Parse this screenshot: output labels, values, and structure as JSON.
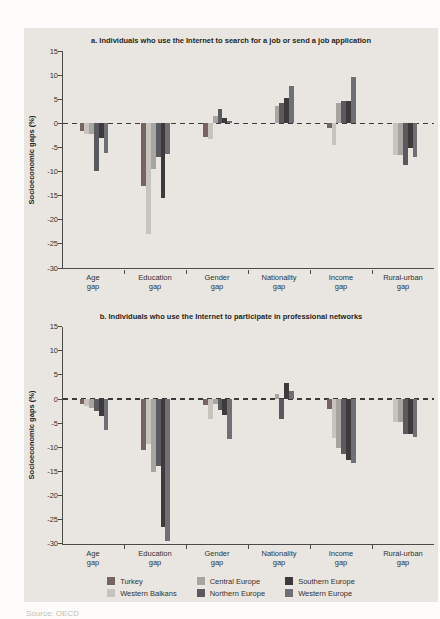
{
  "figure": {
    "source_text": "Source: OECD"
  },
  "legend": {
    "items": [
      {
        "label": "Turkey",
        "color": "#756460"
      },
      {
        "label": "Central Europe",
        "color": "#a8a5a0"
      },
      {
        "label": "Southern Europe",
        "color": "#3e3a3c"
      },
      {
        "label": "Western Balkans",
        "color": "#c7c3be"
      },
      {
        "label": "Northern Europe",
        "color": "#585a60"
      },
      {
        "label": "Western Europe",
        "color": "#6f7076"
      }
    ]
  },
  "chart_data": [
    {
      "type": "bar",
      "title": "a. Individuals who use the Internet to search for a job or send a job application",
      "xlabel": "",
      "ylabel": "Socioeconomic gaps (%)",
      "ylim": [
        -30,
        15
      ],
      "yticks": [
        15,
        10,
        5,
        0,
        -5,
        -10,
        -15,
        -20,
        -25,
        -30
      ],
      "grid": false,
      "zero_baseline": "dashed",
      "legend_position": "below-figure",
      "categories": [
        "Age gap",
        "Education gap",
        "Gender gap",
        "Nationality gap",
        "Income gap",
        "Rural-urban gap"
      ],
      "series": [
        {
          "name": "Turkey",
          "color": "#756460",
          "values": [
            -1.5,
            -13.0,
            -2.8,
            null,
            -1.0,
            null
          ]
        },
        {
          "name": "Western Balkans",
          "color": "#c7c3be",
          "values": [
            -2.2,
            -23.0,
            -3.2,
            null,
            -4.5,
            -6.5
          ]
        },
        {
          "name": "Central Europe",
          "color": "#a8a5a0",
          "values": [
            -2.2,
            -9.5,
            1.5,
            3.5,
            4.2,
            -6.5
          ]
        },
        {
          "name": "Northern Europe",
          "color": "#585a60",
          "values": [
            -9.8,
            -7.0,
            3.0,
            4.2,
            4.6,
            -8.6
          ]
        },
        {
          "name": "Southern Europe",
          "color": "#3e3a3c",
          "values": [
            -3.0,
            -15.5,
            1.2,
            5.2,
            4.6,
            -5.1
          ]
        },
        {
          "name": "Western Europe",
          "color": "#6f7076",
          "values": [
            -6.2,
            -6.3,
            0.5,
            7.8,
            9.7,
            -7.0
          ]
        }
      ]
    },
    {
      "type": "bar",
      "title": "b. Individuals who use the Internet to participate in professional networks",
      "xlabel": "",
      "ylabel": "Socioeconomic gaps (%)",
      "ylim": [
        -30,
        15
      ],
      "yticks": [
        15,
        10,
        5,
        0,
        -5,
        -10,
        -15,
        -20,
        -25,
        -30
      ],
      "grid": false,
      "zero_baseline": "dashed",
      "legend_position": "below-figure",
      "categories": [
        "Age gap",
        "Education gap",
        "Gender gap",
        "Nationality gap",
        "Income gap",
        "Rural-urban gap"
      ],
      "series": [
        {
          "name": "Turkey",
          "color": "#756460",
          "values": [
            -1.0,
            -10.5,
            -1.2,
            null,
            -2.0,
            null
          ]
        },
        {
          "name": "Western Balkans",
          "color": "#c7c3be",
          "values": [
            -1.5,
            -9.3,
            -4.2,
            null,
            -8.0,
            -4.8
          ]
        },
        {
          "name": "Central Europe",
          "color": "#a8a5a0",
          "values": [
            -1.8,
            -15.2,
            -1.0,
            1.0,
            -10.2,
            -4.8
          ]
        },
        {
          "name": "Northern Europe",
          "color": "#585a60",
          "values": [
            -2.5,
            -13.8,
            -2.2,
            -4.2,
            -11.4,
            -7.2
          ]
        },
        {
          "name": "Southern Europe",
          "color": "#3e3a3c",
          "values": [
            -3.6,
            -26.5,
            -3.3,
            3.3,
            -12.7,
            -7.2
          ]
        },
        {
          "name": "Western Europe",
          "color": "#6f7076",
          "values": [
            -6.4,
            -29.4,
            -8.2,
            1.7,
            -13.2,
            -7.8
          ]
        }
      ]
    }
  ]
}
